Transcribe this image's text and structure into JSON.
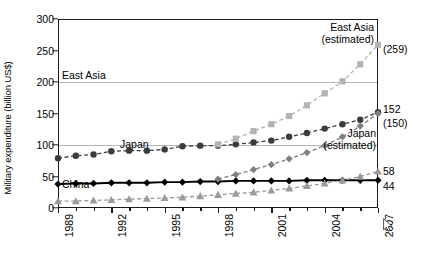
{
  "chart_data": {
    "type": "line",
    "title": "",
    "xlabel": "",
    "ylabel": "Military expenditure (billion US$)",
    "xlim": [
      1989,
      2007
    ],
    "ylim": [
      0,
      300
    ],
    "yticks": [
      0,
      50,
      100,
      150,
      200,
      250,
      300
    ],
    "xticks": [
      1989,
      1992,
      1995,
      1998,
      2001,
      2004,
      2007
    ],
    "xtick_labels": [
      "1989",
      "1992",
      "1995",
      "1998",
      "2001",
      "2004",
      "2007"
    ],
    "gridlines": [
      100,
      200
    ],
    "grid": true,
    "legend_position": "inline-annotations",
    "x": [
      1989,
      1990,
      1991,
      1992,
      1993,
      1994,
      1995,
      1996,
      1997,
      1998,
      1999,
      2000,
      2001,
      2002,
      2003,
      2004,
      2005,
      2006,
      2007
    ],
    "series": [
      {
        "name": "East Asia",
        "marker": "circle",
        "color": "#3c3c3c",
        "linestyle": "dashed",
        "values": [
          79,
          83,
          85,
          90,
          91,
          91,
          93,
          98,
          99,
          99,
          101,
          104,
          107,
          113,
          119,
          126,
          133,
          140,
          152
        ]
      },
      {
        "name": "East Asia (estimated)",
        "marker": "square",
        "color": "#b3b3b3",
        "linestyle": "dashed",
        "values": [
          null,
          null,
          null,
          null,
          null,
          null,
          null,
          null,
          null,
          101,
          110,
          122,
          133,
          146,
          163,
          182,
          201,
          228,
          259
        ]
      },
      {
        "name": "Japan",
        "marker": "diamond",
        "color": "#000000",
        "linestyle": "solid",
        "values": [
          38,
          39,
          39,
          40,
          40,
          40,
          41,
          41,
          42,
          42,
          43,
          43,
          43,
          43,
          44,
          44,
          44,
          44,
          44
        ]
      },
      {
        "name": "Japan (estimated)",
        "marker": "diamond",
        "color": "#808080",
        "linestyle": "dashed",
        "values": [
          null,
          null,
          null,
          null,
          null,
          null,
          null,
          null,
          null,
          46,
          53,
          61,
          69,
          78,
          88,
          99,
          113,
          130,
          150
        ]
      },
      {
        "name": "China",
        "marker": "triangle",
        "color": "#9a9a9a",
        "linestyle": "dashed",
        "values": [
          11,
          11,
          12,
          13,
          14,
          15,
          16,
          17,
          19,
          21,
          23,
          25,
          28,
          31,
          35,
          39,
          44,
          50,
          58
        ]
      }
    ],
    "annotations": [
      {
        "text": "East Asia",
        "x": 1989.2,
        "y": 112
      },
      {
        "text": "Japan",
        "x": 1992.4,
        "y": 57
      },
      {
        "text": "China",
        "x": 1989.2,
        "y": 22
      },
      {
        "text": "East Asia\n(estimated)",
        "x": 2003.0,
        "y": 285
      },
      {
        "text": "Japan\n(estimated)",
        "x": 2006.0,
        "y": 130
      }
    ],
    "right_labels": [
      {
        "text": "(259)",
        "value": 259,
        "series": "East Asia (estimated)"
      },
      {
        "text": "152",
        "value": 152,
        "series": "East Asia"
      },
      {
        "text": "(150)",
        "value": 150,
        "series": "Japan (estimated)"
      },
      {
        "text": "58",
        "value": 58,
        "series": "China"
      },
      {
        "text": "44",
        "value": 44,
        "series": "Japan"
      }
    ],
    "annot_east_asia": "East Asia",
    "annot_japan": "Japan",
    "annot_china": "China",
    "annot_east_asia_est_l1": "East Asia",
    "annot_east_asia_est_l2": "(estimated)",
    "annot_japan_est_l1": "Japan",
    "annot_japan_est_l2": "(estimated)",
    "rlab_259": "(259)",
    "rlab_152": "152",
    "rlab_150": "(150)",
    "rlab_58": "58",
    "rlab_44": "44",
    "ytick_0": "0",
    "ytick_50": "50",
    "ytick_100": "100",
    "ytick_150": "150",
    "ytick_200": "200",
    "ytick_250": "250",
    "ytick_300": "300",
    "xlab_1989": "1989",
    "xlab_1992": "1992",
    "xlab_1995": "1995",
    "xlab_1998": "1998",
    "xlab_2001": "2001",
    "xlab_2004": "2004",
    "xlab_2007": "2007"
  }
}
